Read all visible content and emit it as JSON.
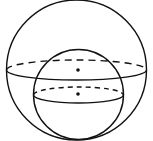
{
  "diagram": {
    "type": "nested-spheres",
    "stroke_color": "#111111",
    "background": "#ffffff",
    "outer_sphere": {
      "cx": 76.5,
      "cy": 70,
      "r": 70,
      "equator_ry": 10
    },
    "inner_sphere": {
      "cx": 78,
      "cy": 95,
      "r": 45,
      "equator_ry": 8
    },
    "centers": [
      {
        "label": "outer-center",
        "x": 78,
        "y": 70
      },
      {
        "label": "inner-center",
        "x": 78,
        "y": 94
      }
    ]
  }
}
